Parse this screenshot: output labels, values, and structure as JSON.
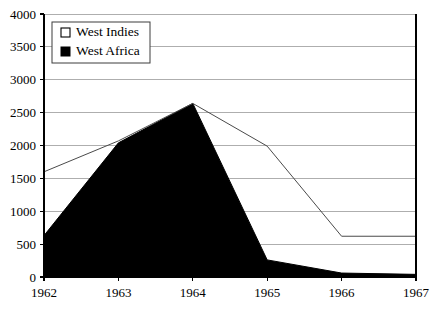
{
  "chart_data": {
    "type": "area",
    "title": "",
    "subtitle": "",
    "xlabel": "",
    "ylabel": "",
    "categories": [
      "1962",
      "1963",
      "1964",
      "1965",
      "1966",
      "1967"
    ],
    "x": [
      1962,
      1963,
      1964,
      1965,
      1966,
      1967
    ],
    "series": [
      {
        "name": "West Indies",
        "values": [
          1600,
          2070,
          2640,
          1990,
          620,
          620
        ],
        "style": "line",
        "marker": "open-square",
        "color": "#ffffff",
        "line_color": "#4a4a4a"
      },
      {
        "name": "West Africa",
        "values": [
          630,
          2040,
          2640,
          260,
          60,
          40
        ],
        "style": "filled-area",
        "marker": "filled-square",
        "color": "#000000",
        "line_color": "#000000"
      }
    ],
    "ylim": [
      0,
      4000
    ],
    "yticks": [
      0,
      500,
      1000,
      1500,
      2000,
      2500,
      3000,
      3500,
      4000
    ],
    "ytick_labels": [
      "0",
      "500",
      "1000",
      "1500",
      "2000",
      "2500",
      "3000",
      "3500",
      "4000"
    ],
    "xtick_labels": [
      "1962",
      "1963",
      "1964",
      "1965",
      "1966",
      "1967"
    ],
    "grid": true,
    "grid_axis": "y",
    "grid_color": "#9a9a9a",
    "legend": {
      "position": "top-left",
      "entries": [
        {
          "label": "West Indies",
          "marker": "open-square"
        },
        {
          "label": "West Africa",
          "marker": "filled-square"
        }
      ]
    },
    "background_color": "#ffffff",
    "axis_color": "#000000"
  }
}
